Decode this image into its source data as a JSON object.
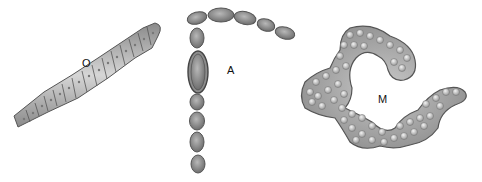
{
  "diagram": {
    "title": "",
    "labels": {
      "oscillatoria": "O",
      "anabaena": "A",
      "microcystis": "M"
    },
    "colors": {
      "cell_fill": "#9a9a9a",
      "cell_light": "#d8d8d8",
      "outline": "#555555",
      "sheath": "#7a7a7a",
      "background": "#ffffff"
    }
  }
}
